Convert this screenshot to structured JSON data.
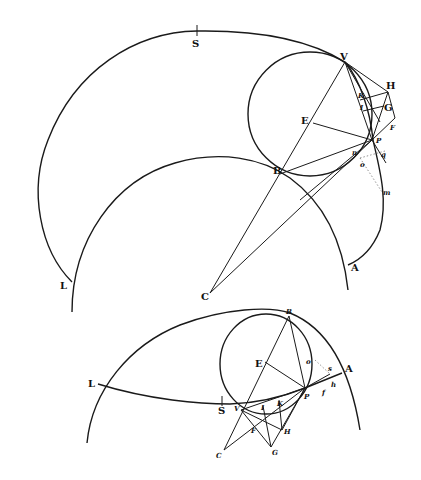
{
  "figure": {
    "top": {
      "labels": {
        "S": "S",
        "V": "V",
        "H": "H",
        "K": "K",
        "I": "I",
        "G": "G",
        "E": "E",
        "P": "P",
        "F": "F",
        "n": "n",
        "q": "q",
        "o": "o",
        "m": "m",
        "B": "B",
        "L": "L",
        "A": "A",
        "C": "C"
      }
    },
    "bottom": {
      "labels": {
        "B": "B",
        "E": "E",
        "o": "o",
        "s": "s",
        "A": "A",
        "L": "L",
        "P": "P",
        "f": "f",
        "h": "h",
        "S": "S",
        "V": "V",
        "I": "I",
        "K": "K",
        "F": "F",
        "H": "H",
        "C": "C",
        "G": "G"
      }
    },
    "colors": {
      "ink": "#1a1a1a",
      "paper": "#ffffff"
    }
  }
}
